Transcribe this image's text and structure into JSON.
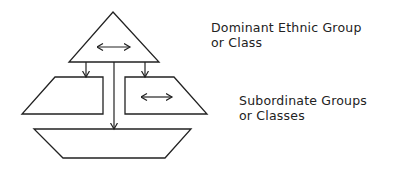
{
  "labels": {
    "dominant": {
      "line1": "Dominant Ethnic Group",
      "line2": "or Class"
    },
    "subordinate": {
      "line1": "Subordinate Groups",
      "line2": "or Classes"
    }
  },
  "colors": {
    "stroke": "#222222",
    "background": "#ffffff"
  },
  "shapes": [
    {
      "name": "dominant-triangle",
      "type": "triangle",
      "interaction": "bidirectional-arrow"
    },
    {
      "name": "left-subordinate-trapezoid",
      "type": "trapezoid"
    },
    {
      "name": "right-subordinate-trapezoid",
      "type": "trapezoid",
      "interaction": "bidirectional-arrow"
    },
    {
      "name": "bottom-subordinate-trapezoid",
      "type": "trapezoid"
    }
  ],
  "connectors": [
    {
      "from": "dominant-triangle",
      "to": "left-subordinate-trapezoid"
    },
    {
      "from": "dominant-triangle",
      "to": "right-subordinate-trapezoid"
    },
    {
      "from": "dominant-triangle",
      "to": "bottom-subordinate-trapezoid"
    }
  ]
}
